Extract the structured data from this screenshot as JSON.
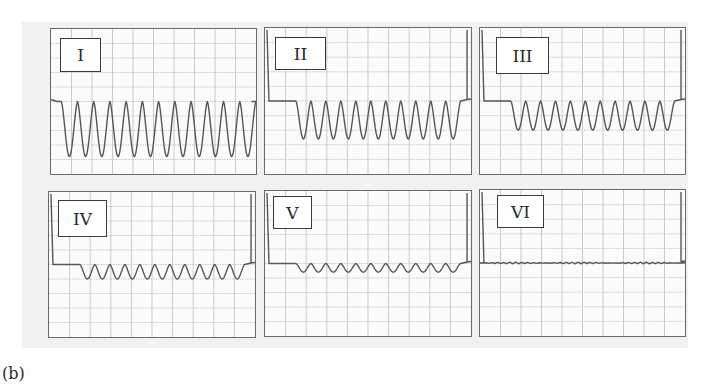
{
  "figure": {
    "caption": "(b)",
    "background_color": "#f1f1f1",
    "grid_color": "#bdbdbd",
    "trace_color": "#555555",
    "grid": {
      "columns": 10,
      "rows": 10
    }
  },
  "chart_data": {
    "type": "line",
    "title": "",
    "xlabel": "",
    "ylabel": "",
    "grid": true,
    "panels": [
      {
        "label": "I",
        "baseline_div": 5.0,
        "dips": 12,
        "depth_div": 3.8,
        "burst_start_div": 0.5,
        "burst_end_div": 10.0,
        "edge_spikes": false
      },
      {
        "label": "II",
        "baseline_div": 5.0,
        "dips": 11,
        "depth_div": 2.6,
        "burst_start_div": 1.5,
        "burst_end_div": 9.5,
        "edge_spikes": true
      },
      {
        "label": "III",
        "baseline_div": 5.0,
        "dips": 11,
        "depth_div": 2.0,
        "burst_start_div": 1.5,
        "burst_end_div": 9.5,
        "edge_spikes": true
      },
      {
        "label": "IV",
        "baseline_div": 5.0,
        "dips": 11,
        "depth_div": 1.0,
        "burst_start_div": 1.5,
        "burst_end_div": 9.5,
        "edge_spikes": true
      },
      {
        "label": "V",
        "baseline_div": 5.0,
        "dips": 11,
        "depth_div": 0.6,
        "burst_start_div": 1.5,
        "burst_end_div": 9.5,
        "edge_spikes": true
      },
      {
        "label": "VI",
        "baseline_div": 5.0,
        "dips": 0,
        "depth_div": 0.05,
        "burst_start_div": 0.0,
        "burst_end_div": 10.0,
        "edge_spikes": true
      }
    ]
  }
}
